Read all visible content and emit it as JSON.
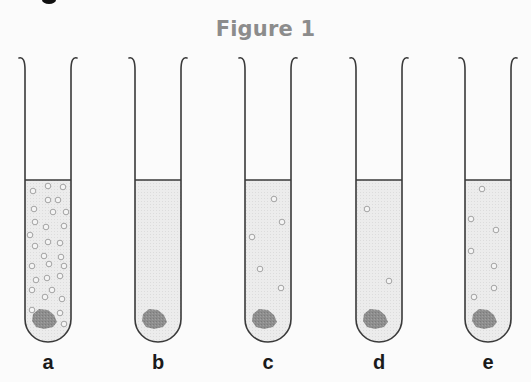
{
  "figure": {
    "title": "Figure 1",
    "colors": {
      "title": "#8c8c8c",
      "outline": "#3a3a3a",
      "liquid": "#ebebeb",
      "sediment": "#8a8a8a",
      "bubble": "#9a9a9a",
      "background": "#fbfbfb"
    },
    "tubes": [
      {
        "label": "a",
        "center_x": 48,
        "bubble_count": 30,
        "bubbles": [
          [
            33,
            191
          ],
          [
            48,
            186
          ],
          [
            63,
            187
          ],
          [
            58,
            200
          ],
          [
            48,
            200
          ],
          [
            34,
            209
          ],
          [
            53,
            212
          ],
          [
            35,
            222
          ],
          [
            66,
            212
          ],
          [
            30,
            235
          ],
          [
            46,
            227
          ],
          [
            64,
            226
          ],
          [
            60,
            243
          ],
          [
            35,
            246
          ],
          [
            48,
            242
          ],
          [
            44,
            256
          ],
          [
            61,
            257
          ],
          [
            32,
            266
          ],
          [
            49,
            264
          ],
          [
            64,
            266
          ],
          [
            36,
            280
          ],
          [
            47,
            278
          ],
          [
            60,
            276
          ],
          [
            32,
            290
          ],
          [
            45,
            297
          ],
          [
            62,
            299
          ],
          [
            52,
            290
          ],
          [
            32,
            310
          ],
          [
            60,
            313
          ],
          [
            64,
            324
          ]
        ]
      },
      {
        "label": "b",
        "center_x": 158,
        "bubble_count": 0,
        "bubbles": []
      },
      {
        "label": "c",
        "center_x": 268,
        "bubble_count": 5,
        "bubbles": [
          [
            274,
            199
          ],
          [
            282,
            222
          ],
          [
            252,
            237
          ],
          [
            260,
            269
          ],
          [
            281,
            288
          ]
        ]
      },
      {
        "label": "d",
        "center_x": 379,
        "bubble_count": 2,
        "bubbles": [
          [
            367,
            209
          ],
          [
            389,
            281
          ]
        ]
      },
      {
        "label": "e",
        "center_x": 488,
        "bubble_count": 7,
        "bubbles": [
          [
            482,
            189
          ],
          [
            471,
            219
          ],
          [
            496,
            230
          ],
          [
            471,
            251
          ],
          [
            494,
            266
          ],
          [
            494,
            288
          ],
          [
            474,
            297
          ]
        ]
      }
    ]
  }
}
